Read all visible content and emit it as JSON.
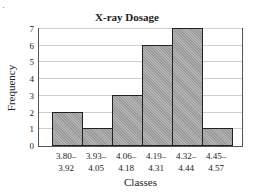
{
  "chart_data": {
    "type": "bar",
    "title": "X-ray Dosage",
    "xlabel": "Classes",
    "ylabel": "Frequency",
    "categories": [
      "3.80–3.92",
      "3.93–4.05",
      "4.06–4.18",
      "4.19–4.31",
      "4.32–4.44",
      "4.45–4.57"
    ],
    "category_lines": [
      [
        "3.80–",
        "3.92"
      ],
      [
        "3.93–",
        "4.05"
      ],
      [
        "4.06–",
        "4.18"
      ],
      [
        "4.19–",
        "4.31"
      ],
      [
        "4.32–",
        "4.44"
      ],
      [
        "4.45–",
        "4.57"
      ]
    ],
    "values": [
      2,
      1,
      3,
      6,
      7,
      1
    ],
    "ylim": [
      0,
      7
    ],
    "yticks": [
      "0",
      "1",
      "2",
      "3",
      "4",
      "5",
      "6",
      "7"
    ],
    "grid": true,
    "legend": null,
    "histogram": true
  },
  "colors": {
    "bar_fill": "#a8a8a8",
    "bar_edge": "#222222",
    "grid": "#cfcfcf"
  },
  "corner_mark": "·"
}
